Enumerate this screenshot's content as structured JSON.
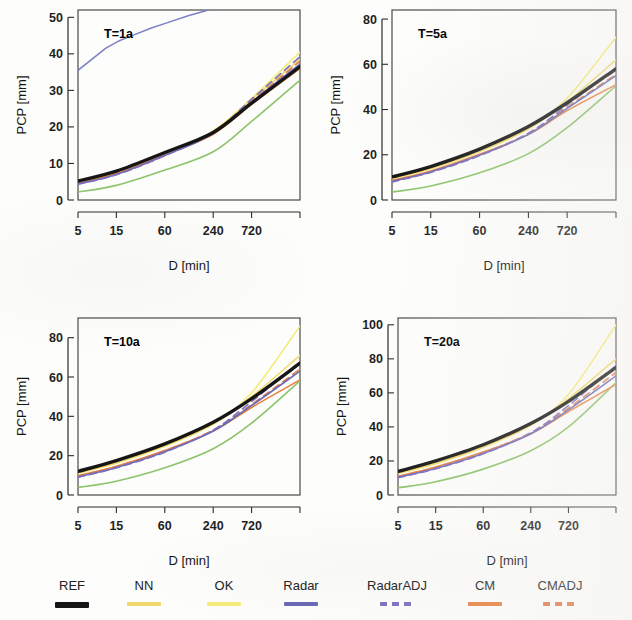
{
  "figure": {
    "axis_x_title": "D [min]",
    "axis_y_title": "PCP [mm]"
  },
  "legend": {
    "items": [
      {
        "label": "REF",
        "color": "#161616",
        "dash": "solid",
        "width": 3.4
      },
      {
        "label": "NN",
        "color": "#f0d96b",
        "dash": "solid",
        "width": 1.6
      },
      {
        "label": "OK",
        "color": "#f5ec7a",
        "dash": "solid",
        "width": 1.6
      },
      {
        "label": "Radar",
        "color": "#6a6ab5",
        "dash": "solid",
        "width": 1.6
      },
      {
        "label": "RadarADJ",
        "color": "#7b6fc0",
        "dash": "dashed",
        "width": 1.6
      },
      {
        "label": "CM",
        "color": "#e8813f",
        "dash": "solid",
        "width": 1.6
      },
      {
        "label": "CMADJ",
        "color": "#e07a4a",
        "dash": "dashed",
        "width": 1.6
      }
    ]
  },
  "chart_data": [
    {
      "type": "line",
      "title": "T=1a",
      "xlabel": "D [min]",
      "ylabel": "PCP [mm]",
      "x_scale": "log",
      "x": [
        5,
        15,
        60,
        240,
        720,
        2880
      ],
      "xticks": [
        5,
        15,
        60,
        240,
        720
      ],
      "xticklabels": [
        "5",
        "15",
        "60",
        "240",
        "720"
      ],
      "yticks": [
        0,
        10,
        20,
        30,
        40,
        50
      ],
      "ylim": [
        0,
        52
      ],
      "grid": false,
      "series": [
        {
          "name": "REF",
          "values": [
            5.2,
            7.9,
            13.0,
            18.5,
            26.5,
            36.5
          ]
        },
        {
          "name": "NN",
          "values": [
            4.9,
            7.6,
            12.8,
            18.8,
            27.5,
            38.5
          ]
        },
        {
          "name": "OK",
          "values": [
            4.8,
            7.5,
            12.7,
            18.9,
            27.8,
            40.5
          ]
        },
        {
          "name": "Radar",
          "values": [
            4.4,
            7.0,
            12.2,
            18.2,
            26.8,
            37.2
          ]
        },
        {
          "name": "RadarADJ",
          "values": [
            4.3,
            6.9,
            12.1,
            18.4,
            27.6,
            39.2
          ]
        },
        {
          "name": "CM",
          "values": [
            4.6,
            7.2,
            12.4,
            18.0,
            26.2,
            36.0
          ]
        },
        {
          "name": "CMADJ",
          "values": [
            4.5,
            7.1,
            12.3,
            18.3,
            27.0,
            38.0
          ]
        },
        {
          "name": "LOW",
          "values": [
            2.2,
            4.0,
            8.2,
            13.2,
            21.5,
            32.8
          ]
        }
      ],
      "artifact_line": {
        "name": "scan-artifact",
        "color": "#7b7fc4",
        "points": [
          [
            5,
            35.5
          ],
          [
            11,
            41.5
          ],
          [
            16,
            43.5
          ],
          [
            40,
            47.0
          ],
          [
            120,
            50.5
          ],
          [
            300,
            53.0
          ]
        ]
      }
    },
    {
      "type": "line",
      "title": "T=5a",
      "xlabel": "D [min]",
      "ylabel": "PCP [mm]",
      "x_scale": "log",
      "x": [
        5,
        15,
        60,
        240,
        720,
        2880
      ],
      "xticks": [
        5,
        15,
        60,
        240,
        720
      ],
      "xticklabels": [
        "5",
        "15",
        "60",
        "240",
        "720"
      ],
      "yticks": [
        0,
        20,
        40,
        60,
        80
      ],
      "ylim": [
        0,
        84
      ],
      "grid": false,
      "series": [
        {
          "name": "REF",
          "values": [
            10.2,
            14.8,
            22.5,
            32.5,
            43.0,
            58.0
          ]
        },
        {
          "name": "NN",
          "values": [
            9.6,
            14.0,
            21.6,
            31.5,
            43.5,
            62.0
          ]
        },
        {
          "name": "OK",
          "values": [
            9.4,
            13.8,
            21.4,
            31.8,
            45.0,
            72.0
          ]
        },
        {
          "name": "Radar",
          "values": [
            8.2,
            12.4,
            19.8,
            29.0,
            40.5,
            55.0
          ]
        },
        {
          "name": "RadarADJ",
          "values": [
            8.0,
            12.2,
            19.6,
            29.5,
            42.0,
            58.5
          ]
        },
        {
          "name": "CM",
          "values": [
            8.6,
            12.8,
            20.2,
            29.0,
            39.5,
            51.0
          ]
        },
        {
          "name": "CMADJ",
          "values": [
            8.4,
            12.6,
            20.0,
            29.4,
            41.0,
            55.5
          ]
        },
        {
          "name": "LOW",
          "values": [
            3.5,
            6.2,
            12.0,
            20.5,
            32.0,
            50.5
          ]
        }
      ]
    },
    {
      "type": "line",
      "title": "T=10a",
      "xlabel": "D [min]",
      "ylabel": "PCP [mm]",
      "x_scale": "log",
      "x": [
        5,
        15,
        60,
        240,
        720,
        2880
      ],
      "xticks": [
        5,
        15,
        60,
        240,
        720
      ],
      "xticklabels": [
        "5",
        "15",
        "60",
        "240",
        "720"
      ],
      "yticks": [
        0,
        20,
        40,
        60,
        80
      ],
      "ylim": [
        0,
        90
      ],
      "grid": false,
      "series": [
        {
          "name": "REF",
          "values": [
            12.0,
            17.5,
            26.0,
            37.0,
            49.0,
            67.0
          ]
        },
        {
          "name": "NN",
          "values": [
            11.2,
            16.4,
            25.0,
            36.0,
            50.0,
            71.0
          ]
        },
        {
          "name": "OK",
          "values": [
            11.0,
            16.2,
            24.8,
            36.2,
            52.0,
            86.0
          ]
        },
        {
          "name": "Radar",
          "values": [
            9.2,
            14.0,
            22.0,
            32.5,
            45.5,
            63.0
          ]
        },
        {
          "name": "RadarADJ",
          "values": [
            9.0,
            13.8,
            21.8,
            33.0,
            47.5,
            67.5
          ]
        },
        {
          "name": "CM",
          "values": [
            9.8,
            14.6,
            22.6,
            32.5,
            44.5,
            58.5
          ]
        },
        {
          "name": "CMADJ",
          "values": [
            9.6,
            14.4,
            22.4,
            33.0,
            46.0,
            64.0
          ]
        },
        {
          "name": "LOW",
          "values": [
            3.8,
            7.0,
            13.8,
            23.5,
            36.5,
            58.0
          ]
        }
      ]
    },
    {
      "type": "line",
      "title": "T=20a",
      "xlabel": "D [min]",
      "ylabel": "PCP [mm]",
      "x_scale": "log",
      "x": [
        5,
        15,
        60,
        240,
        720,
        2880
      ],
      "xticks": [
        5,
        15,
        60,
        240,
        720
      ],
      "xticklabels": [
        "5",
        "15",
        "60",
        "240",
        "720"
      ],
      "yticks": [
        0,
        20,
        40,
        60,
        80,
        100
      ],
      "ylim": [
        0,
        104
      ],
      "grid": false,
      "series": [
        {
          "name": "REF",
          "values": [
            13.8,
            20.0,
            29.5,
            42.0,
            55.0,
            75.0
          ]
        },
        {
          "name": "NN",
          "values": [
            12.8,
            18.6,
            28.2,
            41.0,
            56.5,
            80.0
          ]
        },
        {
          "name": "OK",
          "values": [
            12.6,
            18.4,
            28.0,
            41.2,
            59.0,
            100.0
          ]
        },
        {
          "name": "Radar",
          "values": [
            10.4,
            15.6,
            24.4,
            36.0,
            50.0,
            70.0
          ]
        },
        {
          "name": "RadarADJ",
          "values": [
            10.2,
            15.4,
            24.2,
            36.5,
            52.5,
            76.0
          ]
        },
        {
          "name": "CM",
          "values": [
            11.0,
            16.4,
            25.2,
            36.0,
            49.0,
            65.0
          ]
        },
        {
          "name": "CMADJ",
          "values": [
            10.8,
            16.2,
            25.0,
            36.6,
            51.0,
            72.0
          ]
        },
        {
          "name": "LOW",
          "values": [
            4.2,
            7.8,
            15.2,
            26.0,
            40.0,
            66.0
          ]
        }
      ]
    }
  ]
}
